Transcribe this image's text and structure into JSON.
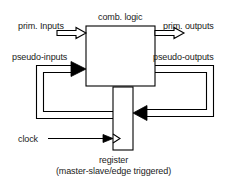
{
  "diagram": {
    "type": "synchronous-sequential-circuit-block-diagram",
    "background_color": "#ffffff",
    "line_color": "#000000",
    "text_color": "#1a1a1a",
    "blocks": {
      "comb_logic": {
        "label": "comb. logic",
        "x": 86,
        "y": 26,
        "width": 69,
        "height": 60
      },
      "register": {
        "label": "register",
        "sublabel": "(master-slave/edge triggered)",
        "x": 113,
        "y": 87,
        "width": 20,
        "height": 63
      }
    },
    "signals": {
      "prim_inputs": "prim. Inputs",
      "prim_outputs": "prim. outputs",
      "pseudo_inputs": "pseudo-inputs",
      "pseudo_outputs": "pseudo-outputs",
      "clock": "clock"
    }
  }
}
